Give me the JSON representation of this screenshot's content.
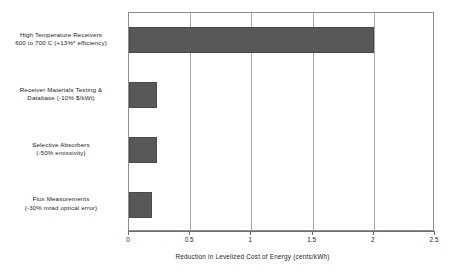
{
  "chart_data": {
    "type": "bar",
    "orientation": "horizontal",
    "title": "",
    "xlabel": "Reduction in Levelized Cost of Energy (cents/kWh)",
    "ylabel": "",
    "xlim": [
      0,
      2.5
    ],
    "xticks": [
      "0",
      "0.5",
      "1",
      "1.5",
      "2",
      "2.5"
    ],
    "xtick_values": [
      0,
      0.5,
      1,
      1.5,
      2,
      2.5
    ],
    "grid": "vertical",
    "legend": "none",
    "bar_color": "#585858",
    "categories": [
      "High Temperature  Receivers 600 to 700 C (+13%* efficiency)",
      "Receiver Materials Testing & Database (-10% $/kWt)",
      "Selective Absorbers (-50% emissivity)",
      "Flux Measurements (-30% mrad optical error)"
    ],
    "category_lines": [
      [
        "High Temperature  Receivers",
        "600 to 700 C (+13%* efficiency)"
      ],
      [
        "Receiver Materials Testing &",
        "Database (-10% $/kWt)"
      ],
      [
        "Selective Absorbers",
        "(-50% emissivity)"
      ],
      [
        "Flux Measurements",
        "(-30% mrad optical error)"
      ]
    ],
    "values": [
      2.0,
      0.23,
      0.23,
      0.19
    ]
  }
}
